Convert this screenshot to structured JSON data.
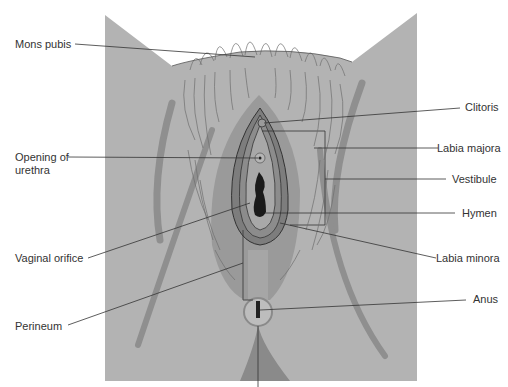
{
  "figure": {
    "type": "anatomical-diagram",
    "colors": {
      "background": "#ffffff",
      "panel": "#b3b3b3",
      "skin_dark": "#8f8f8f",
      "labia_outer": "#9a9a9a",
      "labia_inner": "#7d7d7d",
      "vestibule": "#a8a8a8",
      "orifice": "#1a1a1a",
      "hair": "#6e6e6e",
      "leader_line": "#333333",
      "label_text": "#333333"
    }
  },
  "labels": {
    "left": [
      {
        "id": "mons-pubis",
        "text": "Mons pubis"
      },
      {
        "id": "opening-of-urethra",
        "line1": "Opening of",
        "line2": "urethra"
      },
      {
        "id": "vaginal-orifice",
        "text": "Vaginal orifice"
      },
      {
        "id": "perineum",
        "text": "Perineum"
      }
    ],
    "right": [
      {
        "id": "clitoris",
        "text": "Clitoris"
      },
      {
        "id": "labia-majora",
        "text": "Labia majora"
      },
      {
        "id": "vestibule",
        "text": "Vestibule"
      },
      {
        "id": "hymen",
        "text": "Hymen"
      },
      {
        "id": "labia-minora",
        "text": "Labia minora"
      },
      {
        "id": "anus",
        "text": "Anus"
      }
    ]
  }
}
